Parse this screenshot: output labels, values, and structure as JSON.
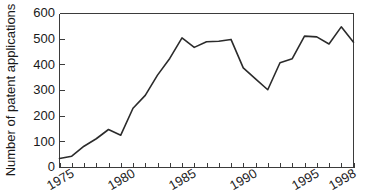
{
  "chart_data": {
    "type": "line",
    "title": "",
    "subtitle": "",
    "xlabel": "",
    "ylabel": "Number of patent applications",
    "xlim": [
      1974,
      1998
    ],
    "ylim": [
      0,
      600
    ],
    "grid": false,
    "legend": null,
    "legend_position": "none",
    "line_color": "#2b2b2b",
    "axis_color": "#3b3b3b",
    "background_color": "#ffffff",
    "y_ticks": [
      0,
      100,
      200,
      300,
      400,
      500,
      600
    ],
    "y_tick_labels": [
      "0",
      "100",
      "200",
      "300",
      "400",
      "500",
      "600"
    ],
    "x_ticks": [
      1975,
      1980,
      1985,
      1990,
      1995,
      1998
    ],
    "x_tick_labels": [
      "1975",
      "1980",
      "1985",
      "1990",
      "1995",
      "1998"
    ],
    "x_minor_ticks": [
      1974,
      1975,
      1976,
      1977,
      1978,
      1979,
      1980,
      1981,
      1982,
      1983,
      1984,
      1985,
      1986,
      1987,
      1988,
      1989,
      1990,
      1991,
      1992,
      1993,
      1994,
      1995,
      1996,
      1997,
      1998
    ],
    "x_tick_label_rotation": -30,
    "series": [
      {
        "name": "Patent applications",
        "x": [
          1974,
          1975,
          1976,
          1977,
          1978,
          1979,
          1980,
          1981,
          1982,
          1983,
          1984,
          1985,
          1986,
          1987,
          1988,
          1989,
          1990,
          1991,
          1992,
          1993,
          1994,
          1995,
          1996,
          1997,
          1998
        ],
        "values": [
          35,
          44,
          83,
          112,
          148,
          126,
          231,
          281,
          360,
          425,
          505,
          468,
          490,
          492,
          499,
          388,
          345,
          303,
          408,
          424,
          512,
          509,
          481,
          548,
          488
        ]
      }
    ]
  },
  "axes": {
    "y_axis_title": "Number of patent applications"
  }
}
